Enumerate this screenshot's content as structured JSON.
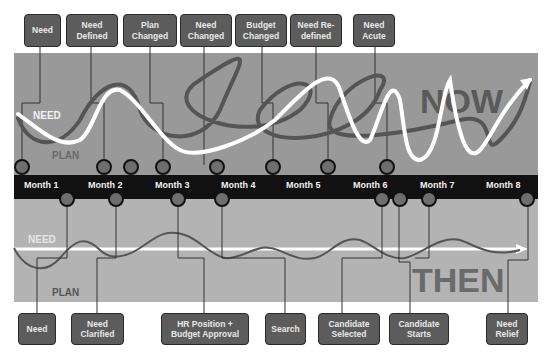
{
  "title_now": "NOW",
  "title_then": "THEN",
  "series_labels": {
    "now_need": "NEED",
    "now_plan": "PLAN",
    "then_need": "NEED",
    "then_plan": "PLAN"
  },
  "months": [
    "Month 1",
    "Month 2",
    "Month 3",
    "Month 4",
    "Month 5",
    "Month 6",
    "Month 7",
    "Month 8"
  ],
  "top_events": [
    {
      "label": "Need"
    },
    {
      "label": "Need\nDefined"
    },
    {
      "label": "Plan\nChanged"
    },
    {
      "label": "Need\nChanged"
    },
    {
      "label": "Budget\nChanged"
    },
    {
      "label": "Need Re-\ndefined"
    },
    {
      "label": "Need\nAcute"
    }
  ],
  "bottom_events": [
    {
      "label": "Need"
    },
    {
      "label": "Need\nClarified"
    },
    {
      "label": "HR Position +\nBudget Approval"
    },
    {
      "label": "Search"
    },
    {
      "label": "Candidate\nSelected"
    },
    {
      "label": "Candidate\nStarts"
    },
    {
      "label": "Need\nRelief"
    }
  ],
  "colors": {
    "top_panel": "#999999",
    "bottom_panel": "#b3b3b3",
    "band": "#111111",
    "need_line": "#ffffff",
    "plan_line": "#555555",
    "label_box": "#5c5c5c",
    "milestone": "#6e6e6e"
  }
}
